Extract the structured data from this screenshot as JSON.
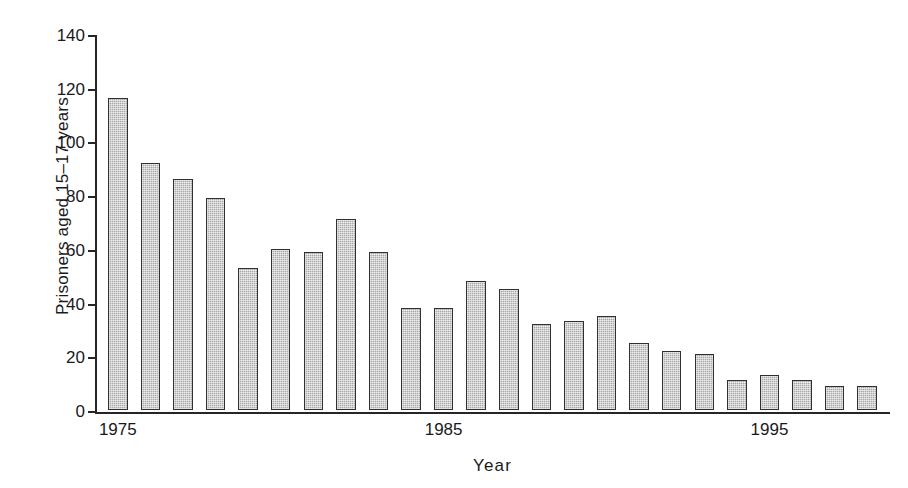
{
  "chart_data": {
    "type": "bar",
    "title": "",
    "subtitle": "",
    "xlabel": "Year",
    "ylabel": "Prisoners aged 15–17 years",
    "categories": [
      1975,
      1976,
      1977,
      1978,
      1979,
      1980,
      1981,
      1982,
      1983,
      1984,
      1985,
      1986,
      1987,
      1988,
      1989,
      1990,
      1991,
      1992,
      1993,
      1994,
      1995,
      1996,
      1997,
      1998
    ],
    "values": [
      116,
      92,
      86,
      79,
      53,
      60,
      59,
      71,
      59,
      38,
      38,
      48,
      45,
      32,
      33,
      35,
      25,
      22,
      21,
      11,
      13,
      11,
      9,
      9
    ],
    "categories_labels": [
      "1975",
      "1976",
      "1977",
      "1978",
      "1979",
      "1980",
      "1981",
      "1982",
      "1983",
      "1984",
      "1985",
      "1986",
      "1987",
      "1988",
      "1989",
      "1990",
      "1991",
      "1992",
      "1993",
      "1994",
      "1995",
      "1996",
      "1997",
      "1998"
    ],
    "xlim": [
      1974.3,
      1998.7
    ],
    "ylim": [
      0,
      140
    ],
    "yticks": [
      0,
      20,
      40,
      60,
      80,
      100,
      120,
      140
    ],
    "ytick_labels": [
      "0",
      "20",
      "40",
      "60",
      "80",
      "100",
      "120",
      "140"
    ],
    "xticks": [
      1975,
      1985,
      1995
    ],
    "xtick_labels": [
      "1975",
      "1985",
      "1995"
    ],
    "grid": false,
    "legend": null,
    "series": [
      {
        "name": "Prisoners aged 15-17 years",
        "values": [
          116,
          92,
          86,
          79,
          53,
          60,
          59,
          71,
          59,
          38,
          38,
          48,
          45,
          32,
          33,
          35,
          25,
          22,
          21,
          11,
          13,
          11,
          9,
          9
        ]
      }
    ],
    "bar_fill_color": "#a9a9a9",
    "bar_edge_color": "#303030",
    "axis_color": "#262626",
    "background_color": "#ffffff"
  }
}
